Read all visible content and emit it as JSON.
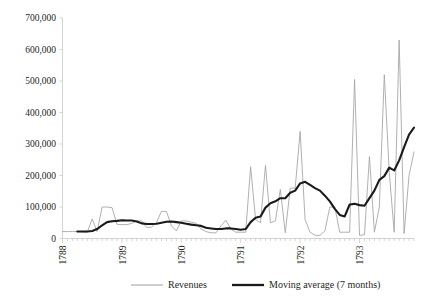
{
  "chart_data": {
    "type": "line",
    "title": "",
    "subtitle": "",
    "xlabel": "",
    "ylabel": "",
    "ylim": [
      0,
      700000
    ],
    "yticks": [
      0,
      100000,
      200000,
      300000,
      400000,
      500000,
      600000,
      700000
    ],
    "ytick_labels": [
      "0",
      "100,000",
      "200,000",
      "300,000",
      "400,000",
      "500,000",
      "600,000",
      "700,000"
    ],
    "xlim": [
      0,
      71
    ],
    "xtick_labels": [
      "1788",
      "1789",
      "1790",
      "1791",
      "1792",
      "1793"
    ],
    "xtick_positions": [
      0,
      12,
      24,
      36,
      48,
      60
    ],
    "x_unit": "month",
    "grid": false,
    "legend_position": "bottom",
    "legend": [
      "Revenues",
      "Moving average (7 months)"
    ],
    "colors": {
      "revenues": "#a7a7a7",
      "moving_average": "#1a1a1a",
      "axis": "#d4d4d4",
      "text": "#231f20",
      "background": "#ffffff"
    },
    "series": [
      {
        "name": "Revenues",
        "color": "#a7a7a7",
        "line_width": 0.9,
        "values": [
          22000,
          22000,
          22000,
          22000,
          21000,
          20000,
          62000,
          22000,
          100000,
          100000,
          98000,
          45000,
          44000,
          44000,
          48000,
          56000,
          56000,
          35000,
          36000,
          52000,
          86000,
          86000,
          40000,
          24000,
          56000,
          56000,
          52000,
          48000,
          30000,
          22000,
          18000,
          18000,
          40000,
          58000,
          30000,
          20000,
          20000,
          20000,
          228000,
          60000,
          50000,
          232000,
          50000,
          56000,
          156000,
          18000,
          160000,
          160000,
          340000,
          60000,
          20000,
          10000,
          10000,
          24000,
          100000,
          100000,
          20000,
          20000,
          20000,
          505000,
          10000,
          12000,
          260000,
          20000,
          100000,
          520000,
          210000,
          20000,
          630000,
          16000,
          200000,
          275000
        ]
      },
      {
        "name": "Moving average (7 months)",
        "color": "#1a1a1a",
        "line_width": 2.1,
        "values": [
          null,
          null,
          null,
          22000,
          22000,
          22000,
          24000,
          30000,
          42000,
          52000,
          55000,
          56000,
          58000,
          57000,
          57000,
          54000,
          48000,
          46000,
          46000,
          47000,
          50000,
          53000,
          54000,
          52000,
          50000,
          47000,
          44000,
          42000,
          40000,
          34000,
          32000,
          30000,
          30000,
          32000,
          32000,
          30000,
          28000,
          30000,
          52000,
          66000,
          70000,
          98000,
          112000,
          118000,
          128000,
          128000,
          145000,
          152000,
          175000,
          180000,
          170000,
          160000,
          152000,
          136000,
          118000,
          94000,
          75000,
          70000,
          108000,
          110000,
          106000,
          104000,
          128000,
          152000,
          186000,
          198000,
          225000,
          216000,
          248000,
          290000,
          330000,
          352000
        ]
      }
    ]
  },
  "legend": {
    "items": [
      {
        "label": "Revenues",
        "style": "thin-gray-line"
      },
      {
        "label": "Moving average (7 months)",
        "style": "thick-black-line"
      }
    ]
  }
}
